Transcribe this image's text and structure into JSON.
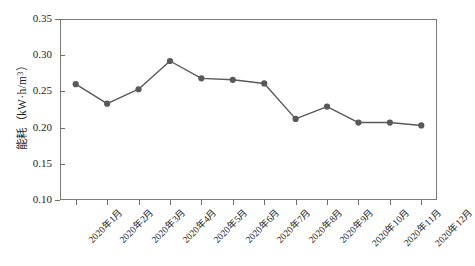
{
  "chart_data": {
    "type": "line",
    "title": "",
    "xlabel": "",
    "ylabel": "能耗（kW·h/m³）",
    "ylabel_text": "能耗（kW·h/m",
    "ylabel_sup": "3",
    "ylabel_tail": "）",
    "categories": [
      "2020年1月",
      "2020年2月",
      "2020年3月",
      "2020年4月",
      "2020年5月",
      "2020年6月",
      "2020年7月",
      "2020年8月",
      "2020年9月",
      "2020年10月",
      "2020年11月",
      "2020年12月"
    ],
    "values": [
      0.26,
      0.233,
      0.253,
      0.292,
      0.268,
      0.266,
      0.261,
      0.212,
      0.229,
      0.207,
      0.207,
      0.203
    ],
    "ylim": [
      0.1,
      0.35
    ],
    "yticks": [
      0.35,
      0.3,
      0.25,
      0.2,
      0.15,
      0.1
    ],
    "ytick_labels": [
      "0.35",
      "0.30",
      "0.25",
      "0.20",
      "0.15",
      "0.10"
    ],
    "grid": false,
    "legend": false,
    "series_color": "#595959",
    "axis_color": "#7a7a7a",
    "marker": "circle",
    "marker_size": 5
  }
}
